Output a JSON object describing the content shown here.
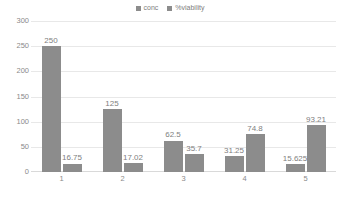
{
  "chart_data": {
    "type": "bar",
    "title": "",
    "subtitle": "",
    "xlabel": "",
    "ylabel": "",
    "categories": [
      "1",
      "2",
      "3",
      "4",
      "5"
    ],
    "series": [
      {
        "name": "conc",
        "color": "#8c8c8c",
        "values": [
          250,
          125,
          62.5,
          31.25,
          15.625
        ],
        "labels": [
          "250",
          "125",
          "62.5",
          "31.25",
          "15.625"
        ]
      },
      {
        "name": "%viability",
        "color": "#8c8c8c",
        "values": [
          16.75,
          17.02,
          35.7,
          74.8,
          93.21
        ],
        "labels": [
          "16.75",
          "17.02",
          "35.7",
          "74.8",
          "93.21"
        ]
      }
    ],
    "ylim": [
      0,
      300
    ],
    "yticks": [
      300,
      250,
      200,
      150,
      100,
      50,
      0
    ],
    "ytick_labels": [
      "300",
      "250",
      "200",
      "150",
      "100",
      "50",
      "0"
    ],
    "grid": true,
    "grid_axis": "y",
    "legend_position": "top-center",
    "data_labels": true,
    "background_color": "#ffffff",
    "grid_color": "#e8e8e8",
    "text_color": "#8a8a8a"
  }
}
